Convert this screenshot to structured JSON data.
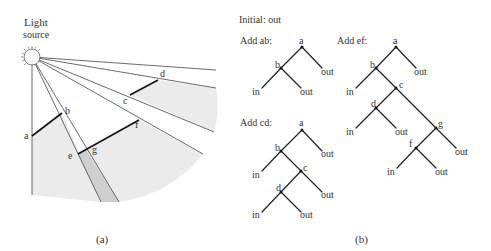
{
  "panel_a": {
    "caption": "(a)",
    "light_source_label_line1": "Light",
    "light_source_label_line2": "source",
    "points": {
      "a": "a",
      "b": "b",
      "c": "c",
      "d": "d",
      "e": "e",
      "f": "f",
      "g": "g"
    },
    "colors": {
      "shadow_light": "#ebebeb",
      "shadow_dark": "#cfcfcf",
      "segment": "#111111",
      "ray": "#444444"
    }
  },
  "panel_b": {
    "caption": "(b)",
    "initial_label": "Initial: out",
    "trees": [
      {
        "title": "Add ab:",
        "nodes": {
          "a": "a",
          "b": "b"
        },
        "leaves": [
          "in",
          "out",
          "out"
        ]
      },
      {
        "title": "Add cd:",
        "nodes": {
          "a": "a",
          "b": "b",
          "c": "c",
          "d": "d"
        },
        "leaves": [
          "in",
          "out",
          "in",
          "out",
          "out"
        ]
      },
      {
        "title": "Add ef:",
        "nodes": {
          "a": "a",
          "b": "b",
          "c": "c",
          "d": "d",
          "g": "g",
          "f": "f"
        },
        "leaves": [
          "in",
          "out",
          "in",
          "out",
          "in",
          "out",
          "out"
        ]
      }
    ]
  }
}
